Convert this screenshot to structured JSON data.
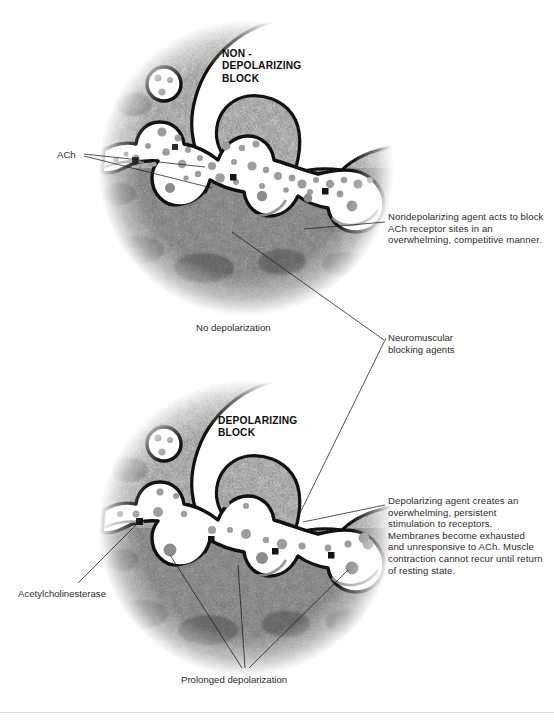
{
  "figure": {
    "kind": "neuromuscular-junction-blockade-diagram",
    "background": "#ffffff"
  },
  "panels": [
    {
      "id": "nondepolarizing",
      "title": "NON -\nDEPOLARIZING\nBLOCK",
      "title_lines": [
        "NON -",
        "DEPOLARIZING",
        "BLOCK"
      ],
      "caption": "No depolarization"
    },
    {
      "id": "depolarizing",
      "title_lines": [
        "DEPOLARIZING",
        "BLOCK"
      ],
      "caption": "Prolonged depolarization"
    }
  ],
  "labels": {
    "ach": "ACh",
    "no_depolarization": "No depolarization",
    "neuromuscular_blocking_agents_line1": "Neuromuscular",
    "neuromuscular_blocking_agents_line2": "blocking agents",
    "acetylcholinesterase": "Acetylcholinesterase",
    "prolonged_depolarization": "Prolonged depolarization"
  },
  "callouts": {
    "nondepolarizing": "Nondepolarizing agent acts to block ACh receptor sites in an overwhelming, competitive manner.",
    "depolarizing": "Depolarizing agent creates an overwhelming, persistent stimulation to receptors. Membranes become exhausted and unresponsive to ACh. Muscle contraction cannot recur until return of resting state."
  },
  "colors": {
    "tissue_dark": "#3a3a3a",
    "tissue_mid": "#7d7d7d",
    "tissue_light": "#b4b4b4",
    "membrane": "#111111",
    "cleft": "#ffffff",
    "ach_dot": "#9a9a9a",
    "receptor_dot": "#8c8c8c",
    "enzyme_square": "#1a1a1a",
    "leader_line": "#1a1a1a",
    "divider": "#d8d8d8",
    "text": "#2b2b2b"
  }
}
